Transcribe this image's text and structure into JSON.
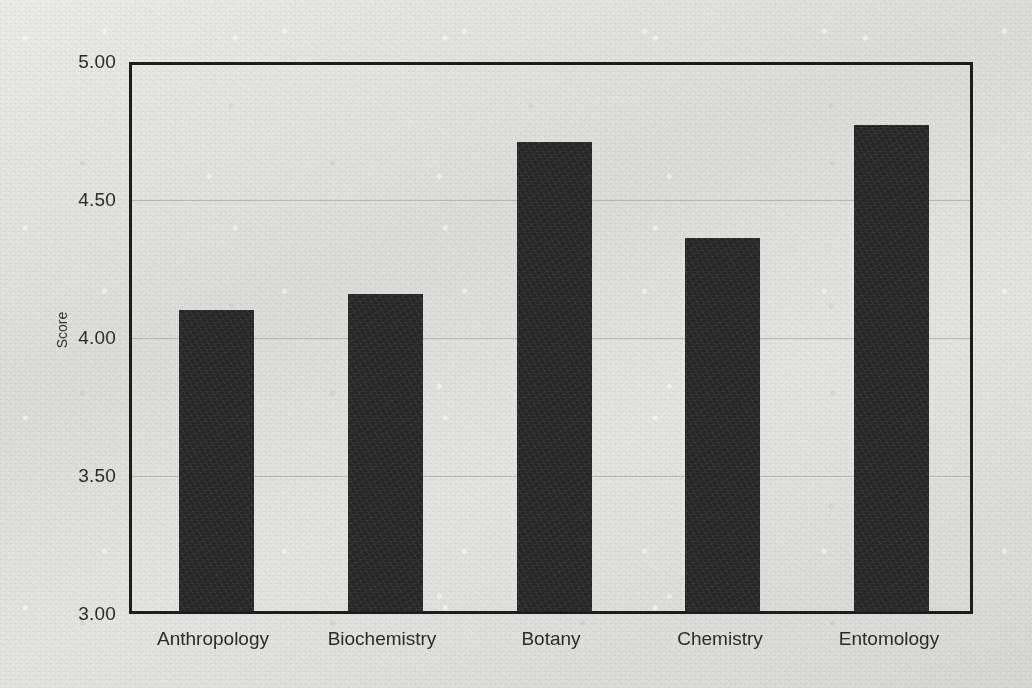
{
  "chart_data": {
    "type": "bar",
    "title": "",
    "subtitle": "",
    "xlabel": "",
    "ylabel": "Score",
    "categories": [
      "Anthropology",
      "Biochemistry",
      "Botany",
      "Chemistry",
      "Entomology"
    ],
    "values": [
      4.09,
      4.15,
      4.7,
      4.35,
      4.76
    ],
    "series": [
      {
        "name": "Score",
        "values": [
          4.09,
          4.15,
          4.7,
          4.35,
          4.76
        ]
      }
    ],
    "ylim": [
      3.0,
      5.0
    ],
    "ytick_labels": [
      "3.00",
      "3.50",
      "4.00",
      "4.50",
      "5.00"
    ],
    "ytick_values": [
      3.0,
      3.5,
      4.0,
      4.5,
      5.0
    ],
    "grid": true,
    "grid_axis": "y",
    "legend": false,
    "legend_position": "none",
    "annotations": [],
    "bar_color": "#262626",
    "axis_color": "#1d1d1d",
    "gridline_color": "#a9a9a7",
    "background_color": "#e2e2e0"
  },
  "figure": {
    "name": "bar-chart-score-by-department"
  }
}
